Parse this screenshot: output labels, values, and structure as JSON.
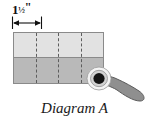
{
  "figure": {
    "caption": "Diagram A",
    "dimension": {
      "whole": "1",
      "fraction_numerator": "1",
      "fraction_denominator": "2",
      "fraction_text": "½",
      "unit_symbol": "\"",
      "full_label": "1½\"",
      "value": 1.5,
      "unit": "inch",
      "measures": "width of one column of the rectangle"
    },
    "shape": {
      "name": "rectangle",
      "columns": 4,
      "rows": 2,
      "total_width_inches": 6,
      "column_width_inches": 1.5,
      "top_row_fill": "#e2e2e2",
      "bottom_row_fill": "#b9b9b9",
      "outline_color": "#8a8a8a",
      "divider_style": "dashed",
      "divider_color": "#5d5d5d",
      "divider_count": 3
    },
    "pushpin": {
      "label": "pushpin",
      "head_outer_color": "#f2f2f2",
      "head_ring_color": "#cfcfcf",
      "head_center_color": "#111111",
      "body_color": "#8f8f8f",
      "body_outline_color": "#555555",
      "position": "bottom-right corner of rectangle"
    },
    "arrow": {
      "name": "double-headed-dimension-arrow",
      "color": "#111111",
      "tick_marks": 2
    }
  }
}
